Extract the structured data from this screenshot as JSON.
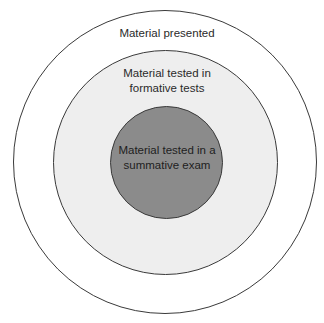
{
  "diagram": {
    "type": "concentric-circles",
    "colors": {
      "outer_fill": "#ffffff",
      "middle_fill": "#eeeeee",
      "inner_fill": "#8b8b8b",
      "stroke": "#3a3a3a",
      "text": "#2a2a2a"
    },
    "circles": [
      {
        "id": "outer",
        "label_lines": [
          "Material presented"
        ]
      },
      {
        "id": "middle",
        "label_lines": [
          "Material tested in",
          "formative tests"
        ]
      },
      {
        "id": "inner",
        "label_lines": [
          "Material tested in a",
          "summative exam"
        ]
      }
    ]
  }
}
